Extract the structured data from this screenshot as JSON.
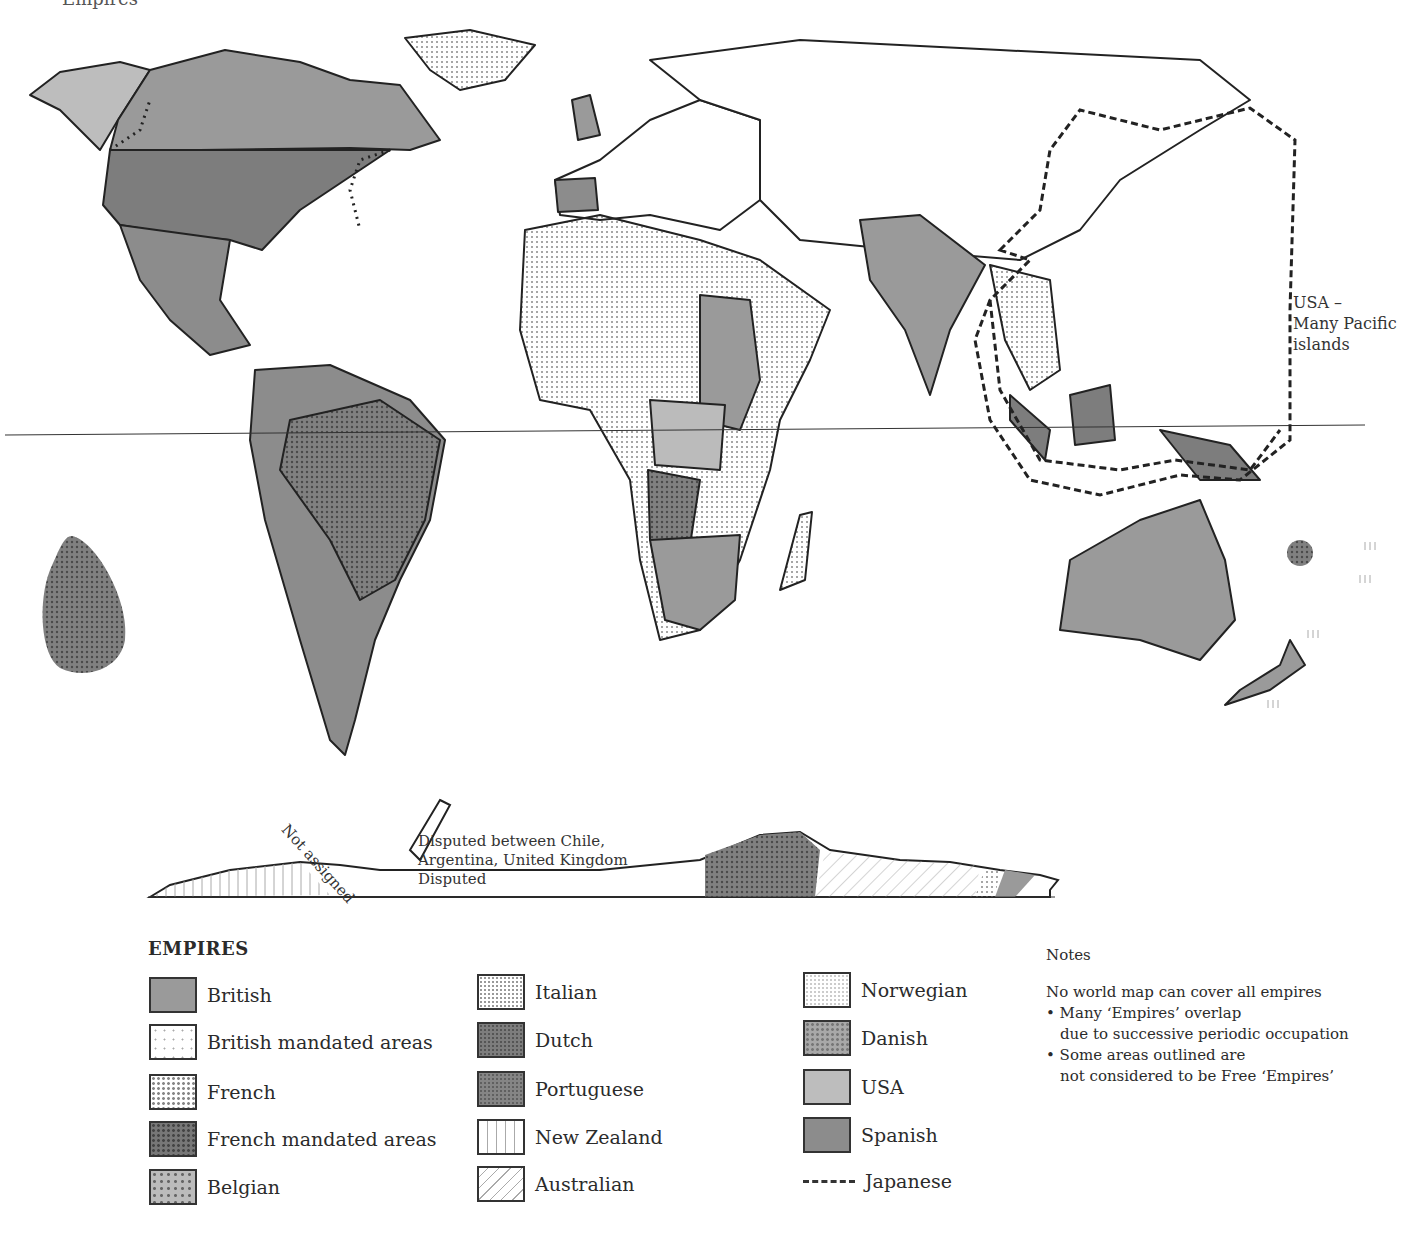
{
  "map": {
    "title": "Empires",
    "annotations": {
      "pacific": [
        "USA –",
        "Many Pacific",
        "islands"
      ],
      "not_assigned": "Not assigned",
      "disputed_lines": [
        "Disputed between Chile,",
        "Argentina, United Kingdom",
        "Disputed"
      ]
    }
  },
  "legend": {
    "title": "EMPIRES",
    "items": [
      {
        "label": "British",
        "pattern": "british"
      },
      {
        "label": "British mandated areas",
        "pattern": "bmand"
      },
      {
        "label": "French",
        "pattern": "french"
      },
      {
        "label": "French mandated areas",
        "pattern": "fmand"
      },
      {
        "label": "Belgian",
        "pattern": "belgian"
      },
      {
        "label": "Italian",
        "pattern": "italian"
      },
      {
        "label": "Dutch",
        "pattern": "dutch"
      },
      {
        "label": "Portuguese",
        "pattern": "port"
      },
      {
        "label": "New Zealand",
        "pattern": "nz"
      },
      {
        "label": "Australian",
        "pattern": "aus"
      },
      {
        "label": "Norwegian",
        "pattern": "norw"
      },
      {
        "label": "Danish",
        "pattern": "danish"
      },
      {
        "label": "USA",
        "pattern": "usa"
      },
      {
        "label": "Spanish",
        "pattern": "spanish"
      },
      {
        "label": "Japanese",
        "pattern": "dashed-line"
      }
    ]
  },
  "notes": {
    "heading": "Notes",
    "intro": "No world map can cover all empires",
    "bullets": [
      {
        "line1": "• Many ‘Empires’ overlap",
        "line2": "due to successive periodic occupation"
      },
      {
        "line1": "• Some areas outlined are",
        "line2": "not considered to be Free ‘Empires’"
      }
    ]
  }
}
